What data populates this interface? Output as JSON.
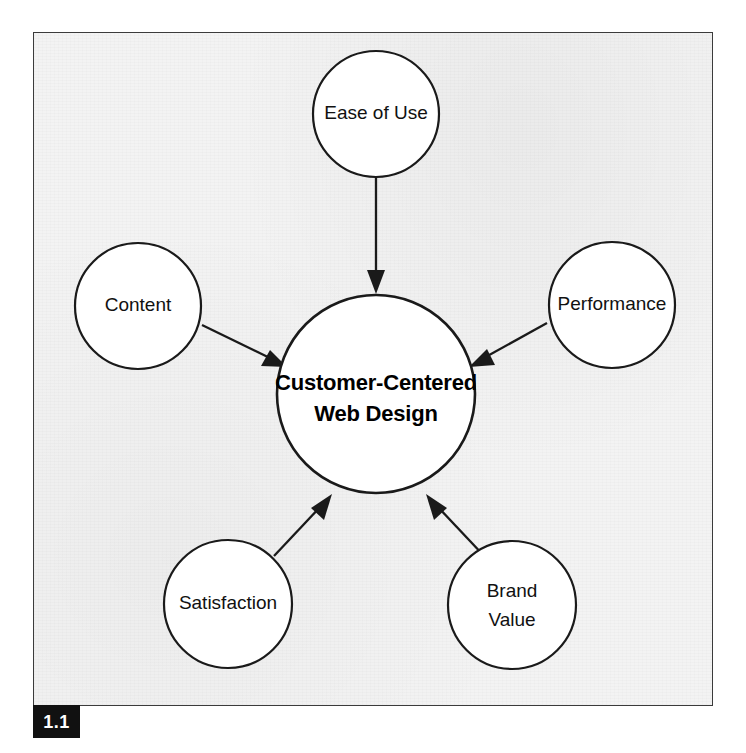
{
  "figure": {
    "number_label": "1.1",
    "background_color": "#f3f3f3",
    "frame_border_color": "#3b3b3b",
    "tag_background_color": "#111111",
    "tag_text_color": "#ffffff"
  },
  "diagram": {
    "type": "hub-and-spoke",
    "stroke_color": "#1a1a1a",
    "node_fill_color": "#ffffff",
    "center": {
      "id": "customer-centered-web-design",
      "label_line_1": "Customer-Centered",
      "label_line_2": "Web Design",
      "bold": true
    },
    "satellites": [
      {
        "id": "ease-of-use",
        "label": "Ease of Use",
        "position": "top",
        "arrow_direction": "into-center"
      },
      {
        "id": "content",
        "label": "Content",
        "position": "left",
        "arrow_direction": "into-center"
      },
      {
        "id": "performance",
        "label": "Performance",
        "position": "right",
        "arrow_direction": "into-center"
      },
      {
        "id": "satisfaction",
        "label": "Satisfaction",
        "position": "bottom-left",
        "arrow_direction": "into-center"
      },
      {
        "id": "brand-value",
        "label_line_1": "Brand",
        "label_line_2": "Value",
        "label": "Brand Value",
        "position": "bottom-right",
        "arrow_direction": "into-center"
      }
    ]
  }
}
